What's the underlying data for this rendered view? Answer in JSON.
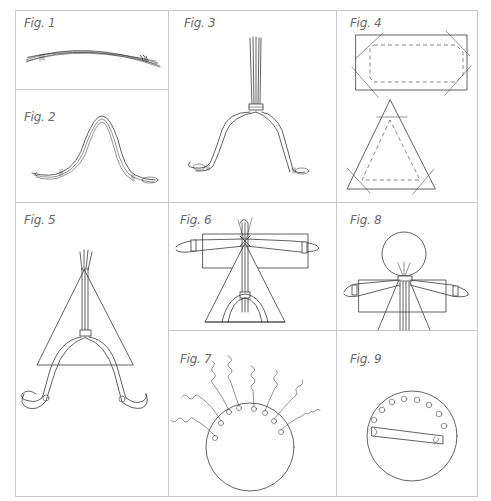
{
  "sheet": {
    "title": "Doll-making instruction figures",
    "grid_color": "#c8c8c8",
    "ink_color": "#3a3a3a",
    "label_color": "#6b6b6b"
  },
  "figures": [
    {
      "id": "fig1",
      "label": "Fig. 1",
      "description": "Bundle of wires bound at both ends, slightly curved"
    },
    {
      "id": "fig2",
      "label": "Fig. 2",
      "description": "Wire bundle bent into an arch with looped feet"
    },
    {
      "id": "fig3",
      "label": "Fig. 3",
      "description": "Arched legs with vertical bundle bound at the top of the arch"
    },
    {
      "id": "fig4",
      "label": "Fig. 4",
      "description": "Rectangle and triangle fabric templates with dashed fold lines and cut corners"
    },
    {
      "id": "fig5",
      "label": "Fig. 5",
      "description": "Triangle fabric placed over the leg armature"
    },
    {
      "id": "fig6",
      "label": "Fig. 6",
      "description": "Arms bound across the body with rectangle fabric behind"
    },
    {
      "id": "fig7",
      "label": "Fig. 7",
      "description": "Circle head with curly wire hair strands"
    },
    {
      "id": "fig8",
      "label": "Fig. 8",
      "description": "Round head attached above arms and body"
    },
    {
      "id": "fig9",
      "label": "Fig. 9",
      "description": "Circle with a ring of small holes and a bar across"
    }
  ]
}
